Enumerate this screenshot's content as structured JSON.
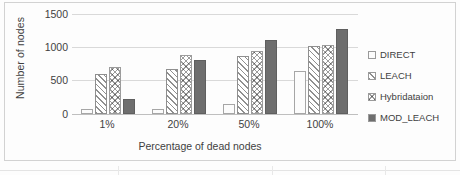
{
  "chart_data": {
    "type": "bar",
    "title": "",
    "xlabel": "Percentage of dead nodes",
    "ylabel": "Number of nodes",
    "categories": [
      "1%",
      "20%",
      "50%",
      "100%"
    ],
    "series": [
      {
        "name": "DIRECT",
        "values": [
          75,
          80,
          150,
          650
        ],
        "fill": "white",
        "color": "#fcfcfc"
      },
      {
        "name": "LEACH",
        "values": [
          600,
          670,
          870,
          1020
        ],
        "fill": "diagonal",
        "color": "#8f8f8f"
      },
      {
        "name": "Hybridataion",
        "values": [
          710,
          890,
          950,
          1030
        ],
        "fill": "crosshatch",
        "color": "#9c9c9c"
      },
      {
        "name": "MOD_LEACH",
        "values": [
          230,
          810,
          1110,
          1270
        ],
        "fill": "solid",
        "color": "#6e6e6e"
      }
    ],
    "ylim": [
      0,
      1500
    ],
    "yticks": [
      0,
      500,
      1000,
      1500
    ],
    "ytick_labels": [
      "0",
      "500",
      "1000",
      "1500"
    ],
    "grid": "horizontal",
    "legend_position": "right"
  },
  "axis": {
    "y_labels": [
      "1500",
      "1000",
      "500",
      "0"
    ],
    "x_labels": [
      "1%",
      "20%",
      "50%",
      "100%"
    ],
    "y_title": "Number of nodes",
    "x_title": "Percentage of dead nodes"
  },
  "legend": {
    "items": [
      {
        "label": "DIRECT"
      },
      {
        "label": "LEACH"
      },
      {
        "label": "Hybridataion"
      },
      {
        "label": "MOD_LEACH"
      }
    ]
  }
}
